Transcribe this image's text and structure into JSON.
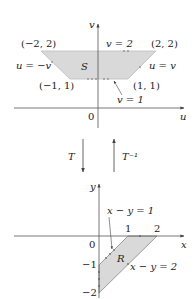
{
  "top_diagram": {
    "region_label": "S",
    "axis_h_label": "u",
    "axis_v_label": "v",
    "origin_label": "0",
    "vertices": [
      {
        "label": "(−2, 2)",
        "u": -2,
        "v": 2
      },
      {
        "label": "(2, 2)",
        "u": 2,
        "v": 2
      },
      {
        "label": "(1, 1)",
        "u": 1,
        "v": 1
      },
      {
        "label": "(−1, 1)",
        "u": -1,
        "v": 1
      }
    ],
    "edges": {
      "top": "v = 2",
      "left": "u = −v",
      "right": "u = v",
      "bottom": "v = 1"
    }
  },
  "transform": {
    "forward_label": "T",
    "inverse_label": "T⁻¹"
  },
  "bottom_diagram": {
    "region_label": "R",
    "axis_h_label": "x",
    "axis_v_label": "y",
    "origin_label": "0",
    "x_ticks": [
      "1",
      "2"
    ],
    "y_ticks": [
      "−1",
      "−2"
    ],
    "edges": {
      "upper": "x − y = 1",
      "lower": "x − y = 2"
    }
  },
  "colors": {
    "region_fill": "#d9d9d9",
    "axis": "#555555",
    "edge_arrows": "#888888"
  }
}
